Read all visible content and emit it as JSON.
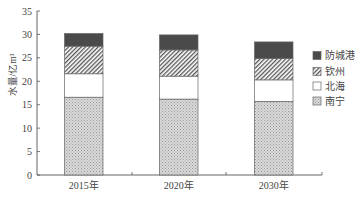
{
  "chart_data": {
    "type": "bar",
    "stacked": true,
    "title": "",
    "xlabel": "",
    "ylabel": "水量/亿m³",
    "ylim": [
      0,
      35
    ],
    "yticks": [
      0,
      5,
      10,
      15,
      20,
      25,
      30,
      35
    ],
    "grid": false,
    "legend_position": "right",
    "categories": [
      "2015年",
      "2020年",
      "2030年"
    ],
    "series": [
      {
        "name": "南宁",
        "values": [
          16.6,
          16.2,
          15.7
        ],
        "fill": "dotted-gray"
      },
      {
        "name": "北海",
        "values": [
          5.0,
          4.9,
          4.6
        ],
        "fill": "white"
      },
      {
        "name": "钦州",
        "values": [
          5.9,
          5.6,
          4.6
        ],
        "fill": "diagonal-hatch"
      },
      {
        "name": "防城港",
        "values": [
          2.7,
          3.2,
          3.5
        ],
        "fill": "dark-gray"
      }
    ],
    "totals": [
      30.2,
      29.9,
      28.4
    ]
  },
  "legend": {
    "items": [
      {
        "label": "防城港",
        "fill": "dark-gray"
      },
      {
        "label": "钦州",
        "fill": "diagonal-hatch"
      },
      {
        "label": "北海",
        "fill": "white"
      },
      {
        "label": "南宁",
        "fill": "dotted-gray"
      }
    ]
  },
  "colors": {
    "axis": "#555555",
    "dark": "#4a4a4a",
    "dots": "#bdbdbd",
    "hatch": "#555555",
    "edge": "#666666"
  }
}
